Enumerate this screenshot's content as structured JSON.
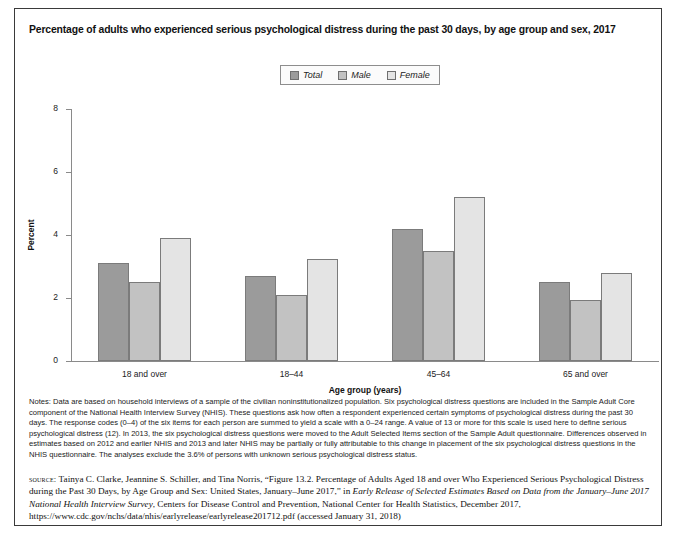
{
  "figure": {
    "title": "Percentage of adults who experienced serious psychological distress during the past 30 days, by age group and sex, 2017"
  },
  "legend": {
    "items": [
      {
        "label": "Total",
        "color": "#9b9b9b"
      },
      {
        "label": "Male",
        "color": "#c2c2c2"
      },
      {
        "label": "Female",
        "color": "#e4e4e4"
      }
    ]
  },
  "notes": {
    "text": "Notes: Data are based on household interviews of a sample of the civilian noninstitutionalized population. Six psychological distress questions are included in the Sample Adult Core component of the National Health Interview Survey (NHIS). These questions ask how often a respondent experienced certain symptoms of psychological distress during the past 30 days. The response codes (0–4) of the six items for each person are summed to yield a scale with a 0–24 range. A value of 13 or more for this scale is used here to define serious psychological distress (12). In 2013, the six psychological distress questions were moved to the Adult Selected Items section of the Sample Adult questionnaire. Differences observed in estimates based on 2012 and earlier NHIS and 2013 and later NHIS may be partially or fully attributable to this change in placement of the six psychological distress questions in the NHIS questionnaire. The analyses exclude the 3.6% of persons with unknown serious psychological distress status."
  },
  "source": {
    "label": "source:",
    "part1": " Tainya C. Clarke, Jeannine S. Schiller, and Tina Norris, “Figure 13.2. Percentage of Adults Aged 18 and over Who Experienced Serious Psychological Distress during the Past 30 Days, by Age Group and Sex: United States, January–June 2017,” in ",
    "italic1": "Early Release of Selected Estimates Based on Data from the January–June 2017 National Health Interview Survey",
    "part2": ", Centers for Disease Control and Prevention, National Center for Health Statistics, December 2017, https://www.cdc.gov/nchs/data/nhis/earlyrelease/earlyrelease201712.pdf (accessed January 31, 2018)"
  },
  "chart_data": {
    "type": "bar",
    "title": "Percentage of adults who experienced serious psychological distress during the past 30 days, by age group and sex, 2017",
    "xlabel": "Age group (years)",
    "ylabel": "Percent",
    "ylim": [
      0,
      8
    ],
    "yticks": [
      0,
      2,
      4,
      6,
      8
    ],
    "grid": false,
    "legend_position": "top-center",
    "categories": [
      "18 and over",
      "18–44",
      "45–64",
      "65 and over"
    ],
    "series": [
      {
        "name": "Total",
        "color": "#9b9b9b",
        "values": [
          3.1,
          2.7,
          4.2,
          2.5
        ]
      },
      {
        "name": "Male",
        "color": "#c2c2c2",
        "values": [
          2.5,
          2.1,
          3.5,
          1.95
        ]
      },
      {
        "name": "Female",
        "color": "#e4e4e4",
        "values": [
          3.9,
          3.25,
          5.2,
          2.8
        ]
      }
    ]
  }
}
